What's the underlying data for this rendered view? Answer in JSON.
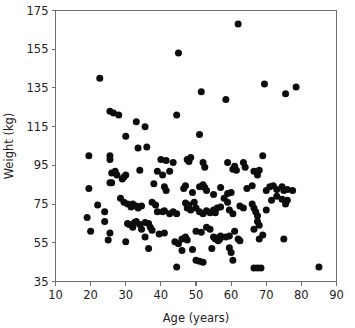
{
  "chart_data": {
    "type": "scatter",
    "title": "",
    "xlabel": "Age (years)",
    "ylabel": "Weight (kg)",
    "xlim": [
      10,
      90
    ],
    "ylim": [
      35,
      175
    ],
    "xticks": [
      10,
      20,
      30,
      40,
      50,
      60,
      70,
      80,
      90
    ],
    "yticks": [
      35,
      55,
      75,
      95,
      115,
      135,
      155,
      175
    ],
    "xtick_labels": [
      "10",
      "20",
      "30",
      "40",
      "50",
      "60",
      "70",
      "80",
      "90"
    ],
    "ytick_labels": [
      "35",
      "55",
      "75",
      "95",
      "115",
      "135",
      "155",
      "175"
    ],
    "grid": false,
    "legend": null,
    "marker": {
      "shape": "circle",
      "color": "#0d0d0d",
      "size_px": 7
    },
    "series": [
      {
        "name": "subjects",
        "n_points": 171,
        "points": [
          [
            22.6,
            140.0
          ],
          [
            45.0,
            153.0
          ],
          [
            62.0,
            168.0
          ],
          [
            69.5,
            137.0
          ],
          [
            78.5,
            135.5
          ],
          [
            75.5,
            132.0
          ],
          [
            51.5,
            133.0
          ],
          [
            58.5,
            129.0
          ],
          [
            25.5,
            123.0
          ],
          [
            26.5,
            122.0
          ],
          [
            28.0,
            121.0
          ],
          [
            44.5,
            121.0
          ],
          [
            33.0,
            117.5
          ],
          [
            35.5,
            115.0
          ],
          [
            30.0,
            110.0
          ],
          [
            51.0,
            111.0
          ],
          [
            33.5,
            104.0
          ],
          [
            36.0,
            104.5
          ],
          [
            19.5,
            100.0
          ],
          [
            25.5,
            100.0
          ],
          [
            25.5,
            98.0
          ],
          [
            40.0,
            98.0
          ],
          [
            41.5,
            97.5
          ],
          [
            47.5,
            98.0
          ],
          [
            48.0,
            97.0
          ],
          [
            48.5,
            99.0
          ],
          [
            69.0,
            100.0
          ],
          [
            43.5,
            96.5
          ],
          [
            52.0,
            96.5
          ],
          [
            52.5,
            94.0
          ],
          [
            59.0,
            96.5
          ],
          [
            63.5,
            96.5
          ],
          [
            64.0,
            94.0
          ],
          [
            60.5,
            93.0
          ],
          [
            61.0,
            94.5
          ],
          [
            61.5,
            92.5
          ],
          [
            26.0,
            91.0
          ],
          [
            27.0,
            92.0
          ],
          [
            27.5,
            90.0
          ],
          [
            29.5,
            89.0
          ],
          [
            30.0,
            90.0
          ],
          [
            34.0,
            92.5
          ],
          [
            39.0,
            92.0
          ],
          [
            40.5,
            90.0
          ],
          [
            42.5,
            92.0
          ],
          [
            66.5,
            92.0
          ],
          [
            67.5,
            90.0
          ],
          [
            25.5,
            86.0
          ],
          [
            29.0,
            88.0
          ],
          [
            19.5,
            83.0
          ],
          [
            26.0,
            86.0
          ],
          [
            38.0,
            85.5
          ],
          [
            41.0,
            84.0
          ],
          [
            41.5,
            82.0
          ],
          [
            46.5,
            83.0
          ],
          [
            47.0,
            84.5
          ],
          [
            49.0,
            81.0
          ],
          [
            51.0,
            84.0
          ],
          [
            52.0,
            85.0
          ],
          [
            52.5,
            83.5
          ],
          [
            53.0,
            82.0
          ],
          [
            55.0,
            80.0
          ],
          [
            57.0,
            83.5
          ],
          [
            59.0,
            80.5
          ],
          [
            60.0,
            81.0
          ],
          [
            64.5,
            83.0
          ],
          [
            66.0,
            84.5
          ],
          [
            68.0,
            92.5
          ],
          [
            70.0,
            82.0
          ],
          [
            71.0,
            84.0
          ],
          [
            72.0,
            84.5
          ],
          [
            73.0,
            82.5
          ],
          [
            74.5,
            84.0
          ],
          [
            75.0,
            82.0
          ],
          [
            76.0,
            82.5
          ],
          [
            77.5,
            82.0
          ],
          [
            22.0,
            74.5
          ],
          [
            24.0,
            71.0
          ],
          [
            28.5,
            78.0
          ],
          [
            29.5,
            76.0
          ],
          [
            30.5,
            75.0
          ],
          [
            31.5,
            73.5
          ],
          [
            32.0,
            75.0
          ],
          [
            33.0,
            74.0
          ],
          [
            33.5,
            73.0
          ],
          [
            34.5,
            74.0
          ],
          [
            37.5,
            76.0
          ],
          [
            38.5,
            74.5
          ],
          [
            39.0,
            71.0
          ],
          [
            40.5,
            71.0
          ],
          [
            41.0,
            71.5
          ],
          [
            42.5,
            70.0
          ],
          [
            43.5,
            71.0
          ],
          [
            44.5,
            70.0
          ],
          [
            47.0,
            75.5
          ],
          [
            47.5,
            73.0
          ],
          [
            48.0,
            74.5
          ],
          [
            48.5,
            72.0
          ],
          [
            49.5,
            76.0
          ],
          [
            50.0,
            73.0
          ],
          [
            51.0,
            71.0
          ],
          [
            52.0,
            70.0
          ],
          [
            53.0,
            71.5
          ],
          [
            54.0,
            70.5
          ],
          [
            55.0,
            72.0
          ],
          [
            55.5,
            70.5
          ],
          [
            56.0,
            73.0
          ],
          [
            57.0,
            73.5
          ],
          [
            58.0,
            78.0
          ],
          [
            59.0,
            76.0
          ],
          [
            59.5,
            72.0
          ],
          [
            60.5,
            70.0
          ],
          [
            62.5,
            74.0
          ],
          [
            63.5,
            73.0
          ],
          [
            66.0,
            75.0
          ],
          [
            66.5,
            73.0
          ],
          [
            67.0,
            71.0
          ],
          [
            67.5,
            69.0
          ],
          [
            67.5,
            66.0
          ],
          [
            68.0,
            64.0
          ],
          [
            70.0,
            72.0
          ],
          [
            71.5,
            77.0
          ],
          [
            73.0,
            79.0
          ],
          [
            74.5,
            77.5
          ],
          [
            75.5,
            75.0
          ],
          [
            76.0,
            77.0
          ],
          [
            19.0,
            68.0
          ],
          [
            20.0,
            61.0
          ],
          [
            24.0,
            66.0
          ],
          [
            25.5,
            60.0
          ],
          [
            30.5,
            65.0
          ],
          [
            31.0,
            64.5
          ],
          [
            32.0,
            63.0
          ],
          [
            32.5,
            65.5
          ],
          [
            33.0,
            66.0
          ],
          [
            34.0,
            64.5
          ],
          [
            34.5,
            62.0
          ],
          [
            35.5,
            65.5
          ],
          [
            36.5,
            65.0
          ],
          [
            37.0,
            63.0
          ],
          [
            37.5,
            61.5
          ],
          [
            39.5,
            59.5
          ],
          [
            41.0,
            60.0
          ],
          [
            46.0,
            57.0
          ],
          [
            47.0,
            58.0
          ],
          [
            47.5,
            56.5
          ],
          [
            50.0,
            61.0
          ],
          [
            51.5,
            60.5
          ],
          [
            53.0,
            63.0
          ],
          [
            54.0,
            62.0
          ],
          [
            55.0,
            58.0
          ],
          [
            55.5,
            57.0
          ],
          [
            56.0,
            57.5
          ],
          [
            56.3,
            56.0
          ],
          [
            56.8,
            57.0
          ],
          [
            57.0,
            58.5
          ],
          [
            58.5,
            58.0
          ],
          [
            59.5,
            58.5
          ],
          [
            61.0,
            61.0
          ],
          [
            62.0,
            57.0
          ],
          [
            62.5,
            56.0
          ],
          [
            66.5,
            62.0
          ],
          [
            68.0,
            57.0
          ],
          [
            69.0,
            59.0
          ],
          [
            75.0,
            57.0
          ],
          [
            25.0,
            56.5
          ],
          [
            30.0,
            55.5
          ],
          [
            35.5,
            58.0
          ],
          [
            36.5,
            52.0
          ],
          [
            44.0,
            55.5
          ],
          [
            45.0,
            54.5
          ],
          [
            46.0,
            51.0
          ],
          [
            49.0,
            51.5
          ],
          [
            54.5,
            52.0
          ],
          [
            59.5,
            52.5
          ],
          [
            60.0,
            50.0
          ],
          [
            44.5,
            42.5
          ],
          [
            50.0,
            46.0
          ],
          [
            51.0,
            45.5
          ],
          [
            52.0,
            45.0
          ],
          [
            60.5,
            46.0
          ],
          [
            66.5,
            42.0
          ],
          [
            67.5,
            42.0
          ],
          [
            68.5,
            42.0
          ],
          [
            85.0,
            42.5
          ]
        ]
      }
    ]
  },
  "axes": {
    "x_axis_label": "Age (years)",
    "y_axis_label": "Weight (kg)"
  }
}
